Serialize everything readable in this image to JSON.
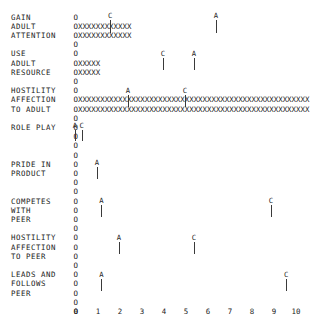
{
  "chart_data": {
    "type": "bar",
    "title": "",
    "xlabel": "",
    "ylabel": "",
    "xlim": [
      0,
      10
    ],
    "xticks": [
      0,
      1,
      2,
      3,
      4,
      5,
      6,
      7,
      8,
      9,
      10
    ],
    "xtick_labels": [
      "0",
      "1",
      "2",
      "3",
      "4",
      "5",
      "6",
      "7",
      "8",
      "9",
      "10"
    ],
    "grid": false,
    "legend": null,
    "bar_fill_char": "X",
    "baseline_char": "O",
    "categories": [
      "GAIN ADULT ATTENTION",
      "USE ADULT RESOURCE",
      "HOSTILITY AFFECTION TO ADULT",
      "ROLE PLAY",
      "PRIDE IN PRODUCT",
      "COMPETES WITH PEER",
      "HOSTILITY AFFECTION TO PEER",
      "LEADS AND FOLLOWS PEER"
    ],
    "values": [
      3.2,
      1.4,
      9.6,
      0.1,
      0.05,
      0.0,
      0.0,
      0.0
    ],
    "series": [
      {
        "name": "A",
        "values": [
          6.4,
          5.4,
          2.4,
          0.0,
          1.0,
          1.2,
          2.0,
          1.2
        ]
      },
      {
        "name": "C",
        "values": [
          1.6,
          4.0,
          0.6,
          0.3,
          null,
          8.9,
          5.4,
          9.6
        ]
      }
    ],
    "annotations": [
      {
        "label": "C",
        "x": 1.6,
        "row": 0
      },
      {
        "label": "A",
        "x": 6.4,
        "row": 0
      },
      {
        "label": "C",
        "x": 4.0,
        "row": 1
      },
      {
        "label": "A",
        "x": 5.4,
        "row": 1
      },
      {
        "label": "A",
        "x": 2.4,
        "row": 2
      },
      {
        "label": "C",
        "x": 5.0,
        "row": 2
      },
      {
        "label": "A",
        "x": 0.0,
        "row": 3
      },
      {
        "label": "C",
        "x": 0.3,
        "row": 3
      },
      {
        "label": "A",
        "x": 1.0,
        "row": 4
      },
      {
        "label": "A",
        "x": 1.2,
        "row": 5
      },
      {
        "label": "C",
        "x": 8.9,
        "row": 5
      },
      {
        "label": "A",
        "x": 2.0,
        "row": 6
      },
      {
        "label": "C",
        "x": 5.4,
        "row": 6
      },
      {
        "label": "A",
        "x": 1.2,
        "row": 7
      },
      {
        "label": "C",
        "x": 9.6,
        "row": 7
      }
    ]
  },
  "rows": [
    {
      "label_lines": [
        "GAIN",
        "ADULT",
        "ATTENTION"
      ]
    },
    {
      "label_lines": [
        "USE",
        "ADULT",
        "RESOURCE"
      ]
    },
    {
      "label_lines": [
        "HOSTILITY",
        "AFFECTION",
        "TO ADULT"
      ]
    },
    {
      "label_lines": [
        "ROLE PLAY"
      ]
    },
    {
      "label_lines": [
        "PRIDE IN",
        "PRODUCT"
      ]
    },
    {
      "label_lines": [
        "COMPETES",
        "WITH",
        "PEER"
      ]
    },
    {
      "label_lines": [
        "HOSTILITY",
        "AFFECTION",
        "TO PEER"
      ]
    },
    {
      "label_lines": [
        "LEADS AND",
        "FOLLOWS",
        "PEER"
      ]
    }
  ],
  "ascii_lines": [
    "O",
    "OXXXXXXXXXXXX",
    "OXXXXXXXXXXXX",
    "O",
    "O",
    "OXXXXX",
    "OXXXXX",
    "O",
    "O",
    "OXXXXXXXXXXXXXXXXXXXXXXXXXXXXXXXXXXXXXXXXXXXXXXXXXXXX",
    "OXXXXXXXXXXXXXXXXXXXXXXXXXXXXXXXXXXXXXXXXXXXXXXXXXXXX",
    "O",
    "O",
    "O",
    "O",
    "O",
    "O",
    "O",
    "O",
    "O",
    "O",
    "O",
    "O",
    "O",
    "O",
    "O",
    "O",
    "O",
    "O",
    "O",
    "O",
    "O",
    "O"
  ]
}
